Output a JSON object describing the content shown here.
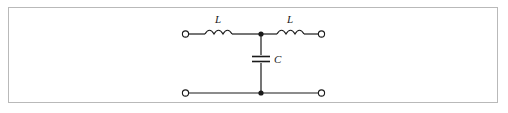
{
  "figure": {
    "kind": "circuit-schematic",
    "name": "T-section LC low-pass filter",
    "background_color": "#ffffff",
    "frame_color": "#b9b9b9",
    "line_color": "#1a1a1a"
  },
  "labels": {
    "inductor_left": "L",
    "inductor_right": "L",
    "capacitor": "C"
  },
  "components": [
    {
      "id": "inductor-left",
      "type": "inductor",
      "label": "L",
      "orientation": "horizontal",
      "coils": 3
    },
    {
      "id": "inductor-right",
      "type": "inductor",
      "label": "L",
      "orientation": "horizontal",
      "coils": 3
    },
    {
      "id": "capacitor-shunt",
      "type": "capacitor",
      "label": "C",
      "orientation": "vertical",
      "plates": 2
    }
  ],
  "terminals": [
    {
      "id": "terminal-top-left",
      "style": "open-circle",
      "x": 185,
      "y": 34
    },
    {
      "id": "terminal-top-right",
      "style": "open-circle",
      "x": 322,
      "y": 34
    },
    {
      "id": "terminal-bottom-left",
      "style": "open-circle",
      "x": 185,
      "y": 93
    },
    {
      "id": "terminal-bottom-right",
      "style": "open-circle",
      "x": 322,
      "y": 93
    }
  ],
  "junctions": [
    {
      "id": "junction-top-center",
      "style": "filled-dot",
      "x": 261,
      "y": 34
    },
    {
      "id": "junction-bottom-center",
      "style": "filled-dot",
      "x": 261,
      "y": 93
    }
  ]
}
